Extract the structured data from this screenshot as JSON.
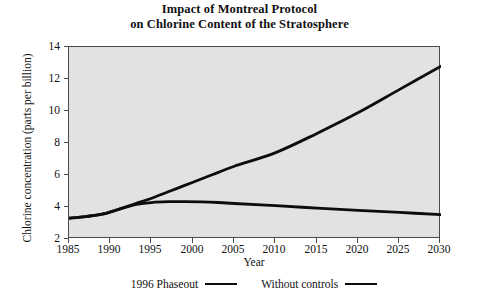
{
  "chart_data": {
    "type": "line",
    "title": "Impact of Montreal Protocol on Chlorine Content of the Stratosphere",
    "title_line1": "Impact of Montreal Protocol",
    "title_line2": "on Chlorine Content of the Stratosphere",
    "xlabel": "Year",
    "ylabel": "Chlorine concentration (parts per billion)",
    "xlim": [
      1985,
      2030
    ],
    "ylim": [
      2,
      14
    ],
    "grid": false,
    "legend_position": "below-axis",
    "plot_background": "#e2e2e2",
    "line_color": "#0d0d0d",
    "xticks": [
      1985,
      1990,
      1995,
      2000,
      2005,
      2010,
      2015,
      2020,
      2025,
      2030
    ],
    "xtick_labels": [
      "1985",
      "1990",
      "1995",
      "2000",
      "2005",
      "2010",
      "2015",
      "2020",
      "2025",
      "2030"
    ],
    "yticks": [
      2,
      4,
      6,
      8,
      10,
      12,
      14
    ],
    "ytick_labels": [
      "2",
      "4",
      "6",
      "8",
      "10",
      "12",
      "14"
    ],
    "series": [
      {
        "name": "1996 Phaseout",
        "x": [
          1985,
          1987,
          1989,
          1991,
          1993,
          1995,
          1997,
          1999,
          2001,
          2003,
          2005,
          2010,
          2015,
          2020,
          2025,
          2030
        ],
        "values": [
          3.3,
          3.4,
          3.55,
          3.85,
          4.15,
          4.28,
          4.33,
          4.34,
          4.32,
          4.28,
          4.22,
          4.08,
          3.93,
          3.79,
          3.66,
          3.52
        ]
      },
      {
        "name": "Without controls",
        "x": [
          1985,
          1987,
          1989,
          1991,
          1993,
          1995,
          1997,
          1999,
          2001,
          2003,
          2005,
          2010,
          2015,
          2020,
          2025,
          2030
        ],
        "values": [
          3.3,
          3.4,
          3.55,
          3.85,
          4.2,
          4.55,
          4.95,
          5.35,
          5.75,
          6.15,
          6.55,
          7.4,
          8.6,
          9.9,
          11.35,
          12.8
        ]
      }
    ]
  },
  "legend": {
    "entries": [
      {
        "label": "1996 Phaseout"
      },
      {
        "label": "Without controls"
      }
    ]
  }
}
